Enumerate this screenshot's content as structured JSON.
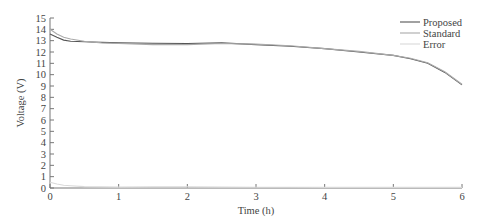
{
  "chart_data": {
    "type": "line",
    "title": "",
    "xlabel": "Time (h)",
    "ylabel": "Voltage (V)",
    "xlim": [
      0,
      6
    ],
    "ylim": [
      0,
      15
    ],
    "xticks": [
      0,
      1,
      2,
      3,
      4,
      5,
      6
    ],
    "yticks": [
      0,
      1,
      2,
      3,
      4,
      5,
      6,
      7,
      8,
      9,
      10,
      11,
      12,
      13,
      14,
      15
    ],
    "grid": false,
    "legend_position": "upper right",
    "x": [
      0,
      0.1,
      0.2,
      0.3,
      0.5,
      0.75,
      1,
      1.5,
      2,
      2.5,
      3,
      3.5,
      4,
      4.5,
      5,
      5.25,
      5.5,
      5.75,
      6
    ],
    "series": [
      {
        "name": "Proposed",
        "color": "#555555",
        "values": [
          13.6,
          13.3,
          13.05,
          12.95,
          12.9,
          12.85,
          12.8,
          12.78,
          12.75,
          12.8,
          12.65,
          12.5,
          12.3,
          12.0,
          11.7,
          11.4,
          11.0,
          10.2,
          9.1
        ]
      },
      {
        "name": "Standard",
        "color": "#aaaaaa",
        "values": [
          14.0,
          13.6,
          13.3,
          13.15,
          12.95,
          12.8,
          12.75,
          12.65,
          12.65,
          12.75,
          12.7,
          12.55,
          12.3,
          12.05,
          11.7,
          11.45,
          11.05,
          10.25,
          9.15
        ]
      },
      {
        "name": "Error",
        "color": "#d9d9d9",
        "values": [
          0.5,
          0.35,
          0.25,
          0.2,
          0.12,
          0.1,
          0.08,
          0.1,
          0.1,
          0.08,
          0.06,
          0.06,
          0.05,
          0.05,
          0.05,
          0.05,
          0.05,
          0.05,
          0.05
        ]
      }
    ]
  },
  "legend": {
    "items": [
      "Proposed",
      "Standard",
      "Error"
    ]
  }
}
